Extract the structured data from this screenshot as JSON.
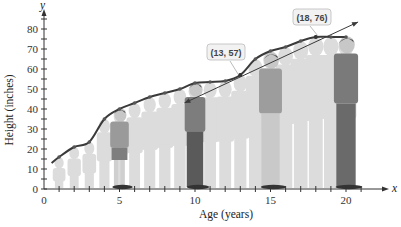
{
  "chart_data": {
    "type": "line",
    "title": "",
    "xlabel": "Age (years)",
    "ylabel": "Height (inches)",
    "x_axis_symbol": "x",
    "y_axis_symbol": "y",
    "xlim": [
      0,
      22
    ],
    "ylim": [
      0,
      88
    ],
    "x_ticks": [
      0,
      5,
      10,
      15,
      20
    ],
    "y_ticks": [
      0,
      10,
      20,
      30,
      40,
      50,
      60,
      70,
      80
    ],
    "grid": false,
    "series": [
      {
        "name": "Height growth curve",
        "x": [
          0.5,
          1,
          2,
          3,
          4,
          5,
          6,
          7,
          8,
          9,
          10,
          11,
          12,
          13,
          14,
          15,
          16,
          17,
          18,
          19,
          20
        ],
        "values": [
          13,
          16,
          21,
          23.5,
          35,
          40,
          43,
          46,
          48,
          50,
          53,
          53.5,
          54,
          57,
          65,
          69,
          71,
          74,
          76,
          76,
          76
        ]
      },
      {
        "name": "Secant line",
        "type": "line-with-arrows",
        "x": [
          9.3,
          13,
          18,
          20.8
        ],
        "values": [
          43,
          57,
          76,
          83.5
        ]
      }
    ],
    "annotations": [
      {
        "label": "(13, 57)",
        "x": 13,
        "y": 57
      },
      {
        "label": "(18, 76)",
        "x": 18,
        "y": 76
      }
    ]
  },
  "axes": {
    "x_title": "Age (years)",
    "y_title": "Height (inches)",
    "x_symbol": "x",
    "y_symbol": "y",
    "x_tick_labels": [
      "0",
      "5",
      "10",
      "15",
      "20"
    ],
    "y_tick_labels": [
      "0",
      "10",
      "20",
      "30",
      "40",
      "50",
      "60",
      "70",
      "80"
    ]
  },
  "annotations": {
    "point_a": "(13, 57)",
    "point_b": "(18, 76)"
  },
  "colors": {
    "curve": "#3a3a3a",
    "dots": "#555555",
    "ghost_figure": "#d9d9d9",
    "figure_dark": "#6f6f6f",
    "label_bg": "#f2f2f2",
    "label_border": "#bbbbbb"
  }
}
